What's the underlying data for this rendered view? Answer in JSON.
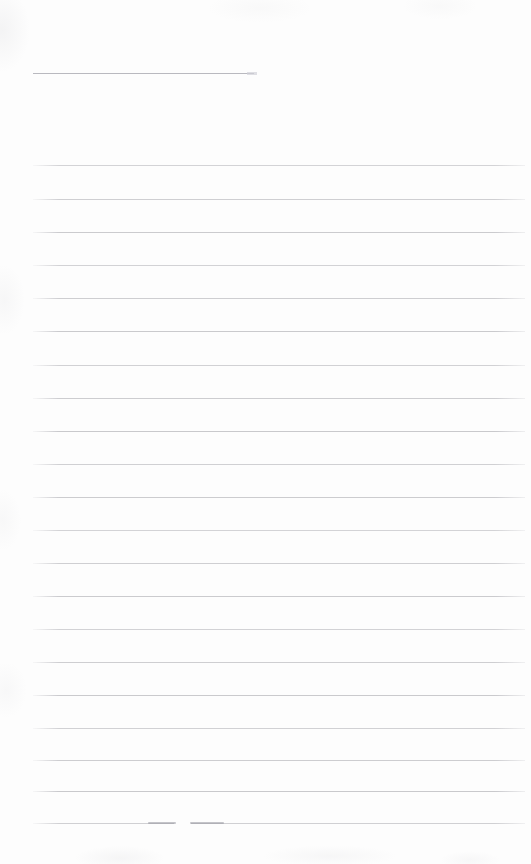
{
  "document": {
    "kind": "scanned-blank-ruled-page",
    "page_width": 531,
    "page_height": 864,
    "background_color": "#fdfdfd",
    "rule_color": "#c8c8cc",
    "title_rule_color": "#b9b9bf",
    "text_content": "",
    "notes": "Blank lined notepaper scan: no printed or handwritten text is present."
  },
  "title_rule": {
    "label": "title-blank",
    "x": 33,
    "y": 73,
    "width": 221
  },
  "ruled_lines": {
    "label": "ruled-lines",
    "left": 33,
    "right": 525,
    "width": 492,
    "spacing": 33,
    "count": 21,
    "y_positions": [
      165,
      199,
      232,
      265,
      298,
      331,
      365,
      398,
      431,
      464,
      497,
      530,
      563,
      596,
      629,
      662,
      695,
      728,
      760,
      791,
      823
    ]
  },
  "artifacts": {
    "label": "scan-artifacts",
    "final_rule_break": {
      "y": 823,
      "gap_start": 174,
      "gap_end": 191
    },
    "ink_marks": [
      {
        "x": 148,
        "y": 822,
        "width": 28
      },
      {
        "x": 190,
        "y": 822,
        "width": 34
      }
    ]
  }
}
